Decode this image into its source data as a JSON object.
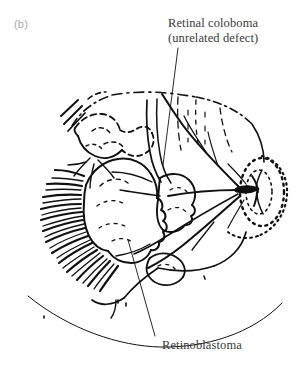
{
  "figure": {
    "panel_label": "(b)",
    "kind": "line-drawing",
    "ink_color": "#111111",
    "background_color": "#ffffff",
    "label_color": "#3a3a38",
    "panel_label_color": "#a8a8a8"
  },
  "callouts": {
    "coloboma": {
      "line1": "Retinal coloboma",
      "line2": "(unrelated defect)"
    },
    "retinoblastoma": {
      "line1": "Retinoblastoma"
    }
  },
  "anatomy": {
    "optic_disc": "optic-disc",
    "tumor_masses": "retinoblastoma-lobules",
    "vessels": "retinal-vessels",
    "coloboma_area": "retinal-coloboma-region",
    "peripheral_hatching": "peripheral-vessel-hatching",
    "limbus_arc": "lower-limbus-arc"
  }
}
